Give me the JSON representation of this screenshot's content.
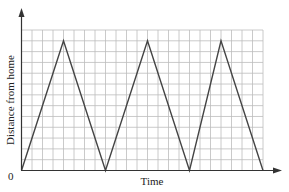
{
  "chart_data": {
    "type": "line",
    "title": "",
    "xlabel": "Time",
    "ylabel": "Distance from home",
    "origin_label": "0",
    "grid": true,
    "grid_columns": 23,
    "grid_rows": 13,
    "xlim": [
      0,
      23
    ],
    "ylim": [
      0,
      13
    ],
    "x_ticks": [],
    "y_ticks": [],
    "legend": null,
    "series": [
      {
        "name": "Distance from home",
        "color": "#444444",
        "points": [
          [
            0,
            0
          ],
          [
            4,
            12
          ],
          [
            8,
            0
          ],
          [
            12,
            12
          ],
          [
            16,
            0
          ],
          [
            19,
            12
          ],
          [
            23,
            0
          ]
        ]
      }
    ]
  },
  "colors": {
    "grid": "#bdbdbd",
    "axis": "#333333",
    "line": "#444444"
  }
}
